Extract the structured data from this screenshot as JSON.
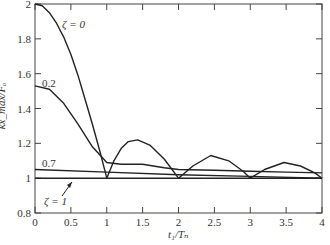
{
  "chart_data": {
    "type": "line",
    "title": "",
    "xlabel": "t1/Tn",
    "ylabel": "kx_max/Fo",
    "xlim": [
      0,
      4
    ],
    "ylim": [
      0.8,
      2
    ],
    "xticks": [
      0,
      0.5,
      1,
      1.5,
      2,
      2.5,
      3,
      3.5,
      4
    ],
    "yticks": [
      0.8,
      1,
      1.2,
      1.4,
      1.6,
      1.8,
      2
    ],
    "grid": false,
    "legend": "inline annotations",
    "series": [
      {
        "name": "ζ = 0",
        "x": [
          0,
          0.1,
          0.2,
          0.3,
          0.4,
          0.5,
          0.6,
          0.7,
          0.8,
          0.9,
          1.0,
          1.1,
          1.2,
          1.3,
          1.43,
          1.6,
          1.8,
          2.0,
          2.2,
          2.45,
          2.7,
          2.9,
          3.0,
          3.2,
          3.47,
          3.7,
          3.9,
          4.0
        ],
        "y": [
          2.0,
          1.99,
          1.95,
          1.89,
          1.81,
          1.71,
          1.59,
          1.45,
          1.31,
          1.16,
          1.0,
          1.1,
          1.17,
          1.21,
          1.22,
          1.19,
          1.11,
          1.0,
          1.07,
          1.13,
          1.1,
          1.04,
          1.0,
          1.05,
          1.09,
          1.07,
          1.03,
          1.0
        ]
      },
      {
        "name": "0.2",
        "x": [
          0,
          0.2,
          0.4,
          0.6,
          0.8,
          1.0,
          1.2,
          1.5,
          1.8,
          2.0,
          2.5,
          3.0,
          3.5,
          4.0
        ],
        "y": [
          1.53,
          1.51,
          1.43,
          1.31,
          1.18,
          1.09,
          1.08,
          1.08,
          1.06,
          1.05,
          1.045,
          1.04,
          1.035,
          1.03
        ]
      },
      {
        "name": "0.7",
        "x": [
          0,
          1,
          2,
          3,
          4
        ],
        "y": [
          1.05,
          1.035,
          1.02,
          1.01,
          1.0
        ]
      },
      {
        "name": "ζ = 1",
        "x": [
          0,
          4
        ],
        "y": [
          1.0,
          1.0
        ]
      }
    ],
    "annotations": [
      "ζ = 0",
      "0.2",
      "0.7",
      "ζ = 1"
    ]
  },
  "labels": {
    "xlabel": "t₁/Tₙ",
    "ylabel": "kx_max/Fₒ",
    "zeta0": "ζ = 0",
    "zeta02": "0.2",
    "zeta07": "0.7",
    "zeta1": "ζ = 1"
  }
}
